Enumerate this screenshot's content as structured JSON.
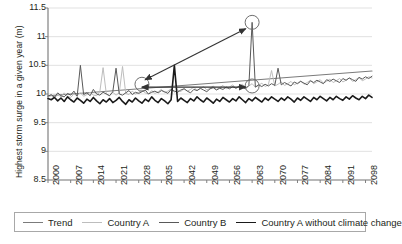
{
  "chart_data": {
    "type": "line",
    "title": "",
    "xlabel": "",
    "ylabel": "Highest storm surge in a given year (m)",
    "xlim": [
      2000,
      2100
    ],
    "ylim": [
      8.5,
      11.5
    ],
    "yticks": [
      "11.5",
      "11",
      "10.5",
      "10",
      "9.5",
      "9",
      "8.5"
    ],
    "ytick_values": [
      11.5,
      11,
      10.5,
      10,
      9.5,
      9,
      8.5
    ],
    "xticks": [
      "2000",
      "2007",
      "2014",
      "2021",
      "2028",
      "2035",
      "2042",
      "2049",
      "2056",
      "2063",
      "2070",
      "2077",
      "2084",
      "2091",
      "2098"
    ],
    "xtick_values": [
      2000,
      2007,
      2014,
      2021,
      2028,
      2035,
      2042,
      2049,
      2056,
      2063,
      2070,
      2077,
      2084,
      2091,
      2098
    ],
    "grid": true,
    "grid_axis": "y",
    "legend_position": "bottom",
    "legend": [
      "Trend",
      "Country A",
      "Country B",
      "Country A without climate change"
    ],
    "series": [
      {
        "name": "Trend",
        "color": "#7b7b7b",
        "width": 1.1,
        "x": [
          2000,
          2100
        ],
        "values": [
          9.97,
          10.4
        ]
      },
      {
        "name": "Country A",
        "color": "#bdbdbd",
        "width": 1.0,
        "x": [
          2000,
          2001,
          2002,
          2003,
          2004,
          2005,
          2006,
          2007,
          2008,
          2009,
          2010,
          2011,
          2012,
          2013,
          2014,
          2015,
          2016,
          2017,
          2018,
          2019,
          2020,
          2021,
          2022,
          2023,
          2024,
          2025,
          2026,
          2027,
          2028,
          2029,
          2030,
          2031,
          2032,
          2033,
          2034,
          2035,
          2036,
          2037,
          2038,
          2039,
          2040,
          2041,
          2042,
          2043,
          2044,
          2045,
          2046,
          2047,
          2048,
          2049,
          2050,
          2051,
          2052,
          2053,
          2054,
          2055,
          2056,
          2057,
          2058,
          2059,
          2060,
          2061,
          2062,
          2063,
          2064,
          2065,
          2066,
          2067,
          2068,
          2069,
          2070,
          2071,
          2072,
          2073,
          2074,
          2075,
          2076,
          2077,
          2078,
          2079,
          2080,
          2081,
          2082,
          2083,
          2084,
          2085,
          2086,
          2087,
          2088,
          2089,
          2090,
          2091,
          2092,
          2093,
          2094,
          2095,
          2096,
          2097,
          2098,
          2099,
          2100
        ],
        "values": [
          9.95,
          9.97,
          9.93,
          9.99,
          9.95,
          10.02,
          9.96,
          9.94,
          10.0,
          9.97,
          10.02,
          9.96,
          9.99,
          10.03,
          9.98,
          9.97,
          10.04,
          10.46,
          10.0,
          9.97,
          10.03,
          9.98,
          10.02,
          10.48,
          10.01,
          9.99,
          10.05,
          10.0,
          10.03,
          10.07,
          10.02,
          10.0,
          10.06,
          10.01,
          10.04,
          10.08,
          10.02,
          10.05,
          10.09,
          10.03,
          10.07,
          10.04,
          10.1,
          10.05,
          10.08,
          10.12,
          10.06,
          10.09,
          10.13,
          10.07,
          10.1,
          10.14,
          10.08,
          10.11,
          10.15,
          10.09,
          10.12,
          10.16,
          10.1,
          10.13,
          10.17,
          10.11,
          10.14,
          10.18,
          10.12,
          10.15,
          10.19,
          10.13,
          10.16,
          10.41,
          10.14,
          10.17,
          10.21,
          10.15,
          10.18,
          10.22,
          10.16,
          10.19,
          10.23,
          10.17,
          10.2,
          10.24,
          10.18,
          10.21,
          10.25,
          10.19,
          10.22,
          10.26,
          10.2,
          10.23,
          10.27,
          10.21,
          10.24,
          10.28,
          10.22,
          10.25,
          10.29,
          10.23,
          10.26,
          10.3,
          10.28
        ]
      },
      {
        "name": "Country B",
        "color": "#595959",
        "width": 1.0,
        "x": [
          2000,
          2001,
          2002,
          2003,
          2004,
          2005,
          2006,
          2007,
          2008,
          2009,
          2010,
          2011,
          2012,
          2013,
          2014,
          2015,
          2016,
          2017,
          2018,
          2019,
          2020,
          2021,
          2022,
          2023,
          2024,
          2025,
          2026,
          2027,
          2028,
          2029,
          2030,
          2031,
          2032,
          2033,
          2034,
          2035,
          2036,
          2037,
          2038,
          2039,
          2040,
          2041,
          2042,
          2043,
          2044,
          2045,
          2046,
          2047,
          2048,
          2049,
          2050,
          2051,
          2052,
          2053,
          2054,
          2055,
          2056,
          2057,
          2058,
          2059,
          2060,
          2061,
          2062,
          2063,
          2064,
          2065,
          2066,
          2067,
          2068,
          2069,
          2070,
          2071,
          2072,
          2073,
          2074,
          2075,
          2076,
          2077,
          2078,
          2079,
          2080,
          2081,
          2082,
          2083,
          2084,
          2085,
          2086,
          2087,
          2088,
          2089,
          2090,
          2091,
          2092,
          2093,
          2094,
          2095,
          2096,
          2097,
          2098,
          2099,
          2100
        ],
        "values": [
          9.96,
          9.99,
          9.94,
          10.02,
          9.97,
          9.95,
          10.01,
          9.98,
          10.05,
          9.96,
          10.5,
          9.99,
          10.02,
          9.97,
          10.08,
          10.0,
          9.98,
          10.03,
          10.0,
          9.97,
          10.04,
          10.45,
          10.0,
          9.98,
          10.02,
          10.06,
          9.99,
          10.03,
          10.01,
          10.04,
          10.07,
          10.0,
          10.03,
          10.05,
          10.02,
          10.06,
          10.04,
          10.01,
          10.08,
          10.05,
          10.03,
          10.07,
          10.09,
          10.05,
          10.02,
          10.08,
          10.06,
          10.1,
          10.07,
          10.04,
          10.09,
          10.11,
          10.07,
          10.1,
          10.08,
          10.12,
          10.09,
          10.13,
          10.1,
          10.14,
          10.11,
          10.09,
          10.15,
          11.25,
          10.12,
          10.16,
          10.13,
          10.17,
          10.14,
          10.18,
          10.15,
          10.45,
          10.16,
          10.2,
          10.17,
          10.14,
          10.21,
          10.18,
          10.22,
          10.19,
          10.16,
          10.23,
          10.2,
          10.24,
          10.21,
          10.18,
          10.25,
          10.22,
          10.26,
          10.23,
          10.2,
          10.27,
          10.24,
          10.28,
          10.25,
          10.22,
          10.29,
          10.26,
          10.3,
          10.27,
          10.31
        ]
      },
      {
        "name": "Country A without climate change",
        "color": "#1a1a1a",
        "width": 1.6,
        "x": [
          2000,
          2001,
          2002,
          2003,
          2004,
          2005,
          2006,
          2007,
          2008,
          2009,
          2010,
          2011,
          2012,
          2013,
          2014,
          2015,
          2016,
          2017,
          2018,
          2019,
          2020,
          2021,
          2022,
          2023,
          2024,
          2025,
          2026,
          2027,
          2028,
          2029,
          2030,
          2031,
          2032,
          2033,
          2034,
          2035,
          2036,
          2037,
          2038,
          2039,
          2040,
          2041,
          2042,
          2043,
          2044,
          2045,
          2046,
          2047,
          2048,
          2049,
          2050,
          2051,
          2052,
          2053,
          2054,
          2055,
          2056,
          2057,
          2058,
          2059,
          2060,
          2061,
          2062,
          2063,
          2064,
          2065,
          2066,
          2067,
          2068,
          2069,
          2070,
          2071,
          2072,
          2073,
          2074,
          2075,
          2076,
          2077,
          2078,
          2079,
          2080,
          2081,
          2082,
          2083,
          2084,
          2085,
          2086,
          2087,
          2088,
          2089,
          2090,
          2091,
          2092,
          2093,
          2094,
          2095,
          2096,
          2097,
          2098,
          2099,
          2100
        ],
        "values": [
          9.92,
          9.9,
          9.94,
          9.88,
          9.93,
          9.87,
          9.95,
          9.9,
          9.86,
          9.93,
          9.89,
          9.84,
          9.91,
          9.87,
          9.94,
          9.88,
          9.83,
          9.9,
          9.86,
          9.92,
          9.85,
          9.89,
          9.94,
          9.87,
          9.82,
          9.9,
          9.86,
          9.93,
          9.88,
          9.84,
          9.91,
          9.87,
          9.95,
          9.89,
          9.85,
          9.92,
          9.88,
          9.83,
          9.9,
          10.5,
          9.87,
          9.93,
          9.89,
          9.85,
          9.92,
          9.88,
          9.95,
          9.9,
          9.86,
          9.93,
          9.89,
          9.84,
          9.91,
          9.87,
          9.94,
          9.9,
          9.86,
          9.92,
          9.88,
          9.95,
          9.9,
          9.85,
          9.92,
          9.88,
          9.94,
          9.9,
          9.86,
          9.93,
          9.89,
          9.95,
          9.91,
          9.87,
          9.93,
          9.89,
          9.95,
          9.91,
          9.86,
          9.93,
          9.89,
          9.95,
          9.91,
          9.87,
          9.94,
          9.9,
          9.96,
          9.92,
          9.88,
          9.94,
          9.9,
          9.96,
          9.92,
          9.89,
          9.95,
          9.91,
          9.97,
          9.93,
          9.9,
          9.96,
          9.92,
          9.98,
          9.94
        ]
      }
    ],
    "annotations": [
      {
        "type": "circle",
        "name": "circle-country-a-peak",
        "x": 2029,
        "y": 10.17,
        "r": 7
      },
      {
        "type": "circle",
        "name": "circle-country-b-extreme-peak",
        "x": 2063,
        "y": 11.25,
        "r": 7
      },
      {
        "type": "circle",
        "name": "circle-country-b-baseline",
        "x": 2063,
        "y": 10.14,
        "r": 7
      },
      {
        "type": "arrow",
        "name": "arrow-diagonal",
        "x1": 2030,
        "y1": 10.25,
        "x2": 2061,
        "y2": 11.14,
        "double": true
      },
      {
        "type": "arrow",
        "name": "arrow-horizontal",
        "x1": 2029,
        "y1": 10.12,
        "x2": 2061,
        "y2": 10.12,
        "double": true
      }
    ],
    "colors": {
      "trend": "#7b7b7b",
      "country_a": "#bdbdbd",
      "country_b": "#595959",
      "country_a_no_climate": "#1a1a1a",
      "grid": "#d9d9d9",
      "axis": "#808080",
      "text": "#231f20",
      "legend_border": "#a8a8a8"
    }
  }
}
